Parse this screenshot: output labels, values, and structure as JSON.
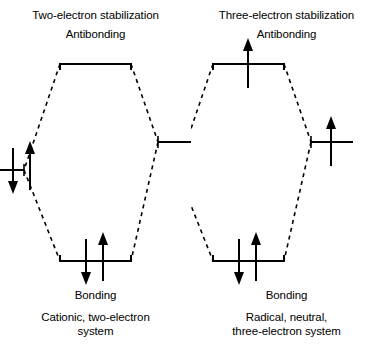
{
  "figure": {
    "type": "molecular-orbital-interaction-diagram",
    "stroke_color": "#000000",
    "background_color": "#ffffff"
  },
  "panels": [
    {
      "id": "two-electron",
      "title": "Two-electron stabilization",
      "subtitle": "Antibonding",
      "bonding_label": "Bonding",
      "caption_line1": "Cationic, two-electron",
      "caption_line2": "system",
      "caption_full": "Cationic, two-electron system",
      "levels": {
        "antibonding": {
          "label": "Antibonding",
          "electrons": "",
          "electron_count": 0
        },
        "left_atomic": {
          "label": "",
          "electrons": "↓↑",
          "electron_count": 2
        },
        "right_atomic": {
          "label": "",
          "electrons": "",
          "electron_count": 0
        },
        "bonding": {
          "label": "Bonding",
          "electrons": "↓↑",
          "electron_count": 2
        }
      },
      "total_electrons": 2
    },
    {
      "id": "three-electron",
      "title": "Three-electron stabilization",
      "subtitle": "Antibonding",
      "bonding_label": "Bonding",
      "caption_line1": "Radical, neutral,",
      "caption_line2": "three-electron system",
      "caption_full": "Radical, neutral, three-electron system",
      "levels": {
        "antibonding": {
          "label": "Antibonding",
          "electrons": "↑",
          "electron_count": 1
        },
        "left_atomic": {
          "label": "",
          "electrons": "↓↑",
          "electron_count": 2
        },
        "right_atomic": {
          "label": "",
          "electrons": "↑",
          "electron_count": 1
        },
        "bonding": {
          "label": "Bonding",
          "electrons": "↓↑",
          "electron_count": 2
        }
      },
      "total_electrons": 3
    }
  ]
}
